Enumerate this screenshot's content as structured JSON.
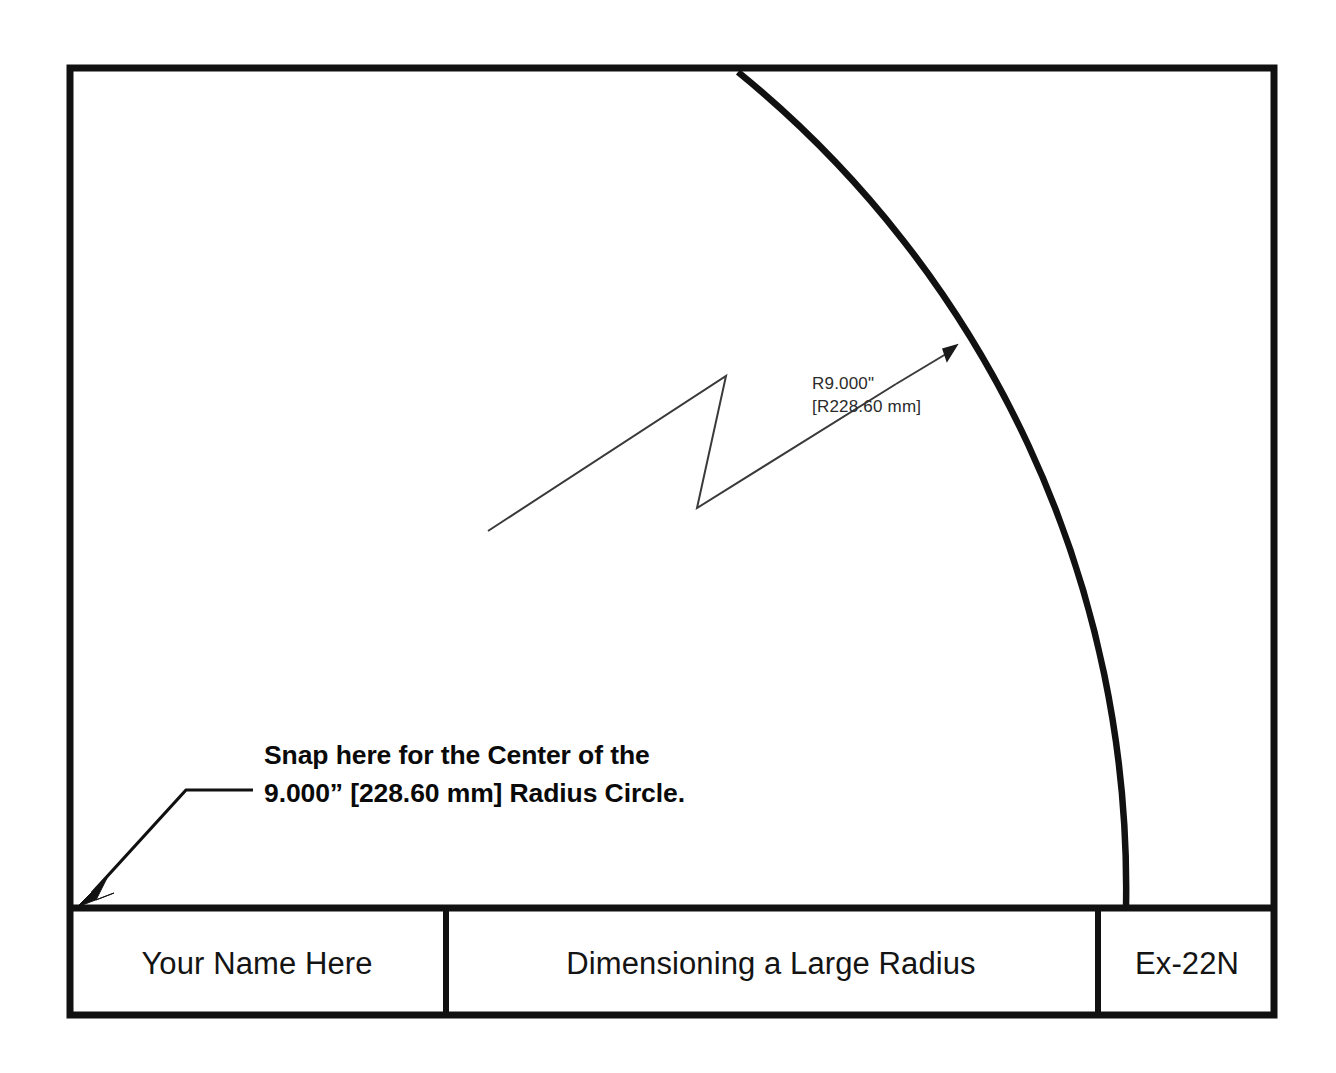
{
  "sheet": {
    "background_color": "#ffffff",
    "line_color": "#111111"
  },
  "drawing": {
    "dimension_callout": {
      "line1": "R9.000\"",
      "line2": "[R228.60 mm]"
    },
    "note": {
      "line1": "Snap here for the Center of the",
      "line2": "9.000” [228.60 mm] Radius Circle."
    }
  },
  "title_block": {
    "name": "Your Name Here",
    "title": "Dimensioning a Large Radius",
    "number": "Ex-22N"
  }
}
